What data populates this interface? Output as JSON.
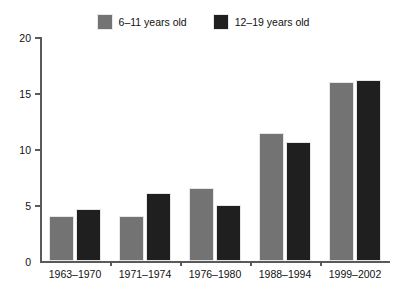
{
  "chart_data": {
    "type": "bar",
    "title": "",
    "subtitle": "",
    "xlabel": "",
    "ylabel": "",
    "ylim": [
      0,
      20
    ],
    "yticks": [
      0,
      5,
      10,
      15,
      20
    ],
    "ytick_labels": [
      "0",
      "5",
      "10",
      "15",
      "20"
    ],
    "grid": false,
    "legend_position": "top-center",
    "categories": [
      "1963–1970",
      "1971–1974",
      "1976–1980",
      "1988–1994",
      "1999–2002"
    ],
    "series": [
      {
        "name": "6–11 years old",
        "color": "#737373",
        "values": [
          4.0,
          4.0,
          6.5,
          11.4,
          16.0
        ]
      },
      {
        "name": "12–19 years old",
        "color": "#1f1f1f",
        "values": [
          4.6,
          6.1,
          5.0,
          10.6,
          16.2
        ]
      }
    ]
  },
  "legend": {
    "entries": [
      {
        "label": "6–11 years old",
        "color": "#737373",
        "swatch_name": "legend-swatch-6-11"
      },
      {
        "label": "12–19 years old",
        "color": "#1f1f1f",
        "swatch_name": "legend-swatch-12-19"
      }
    ]
  },
  "axes": {
    "y": {
      "ticks": [
        "20",
        "15",
        "10",
        "5",
        "0"
      ]
    },
    "x": {
      "labels": [
        "1963–1970",
        "1971–1974",
        "1976–1980",
        "1988–1994",
        "1999–2002"
      ]
    }
  },
  "colors": {
    "series_1": "#737373",
    "series_2": "#1f1f1f",
    "axis": "#5a5a5a",
    "text": "#111111",
    "background": "#ffffff"
  }
}
